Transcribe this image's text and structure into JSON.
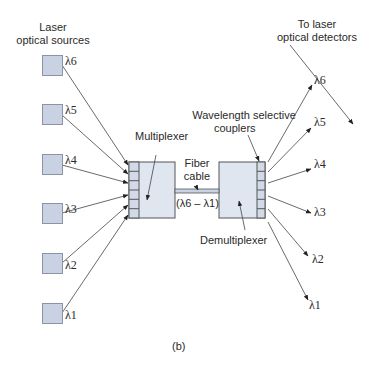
{
  "diagram": {
    "type": "wavelength-division-multiplexing",
    "caption": "(b)",
    "labels": {
      "sources_title_line1": "Laser",
      "sources_title_line2": "optical sources",
      "detectors_title_line1": "To laser",
      "detectors_title_line2": "optical detectors",
      "multiplexer": "Multiplexer",
      "demultiplexer": "Demultiplexer",
      "couplers_line1": "Wavelength selective",
      "couplers_line2": "couplers",
      "fiber_line1": "Fiber",
      "fiber_line2": "cable",
      "fiber_range": "(λ6 – λ1)"
    },
    "sources": [
      {
        "id": "source-6",
        "label": "λ6"
      },
      {
        "id": "source-5",
        "label": "λ5"
      },
      {
        "id": "source-4",
        "label": "λ4"
      },
      {
        "id": "source-3",
        "label": "λ3"
      },
      {
        "id": "source-2",
        "label": "λ2"
      },
      {
        "id": "source-1",
        "label": "λ1"
      }
    ],
    "outputs": [
      {
        "id": "output-6",
        "label": "λ6"
      },
      {
        "id": "output-5",
        "label": "λ5"
      },
      {
        "id": "output-4",
        "label": "λ4"
      },
      {
        "id": "output-3",
        "label": "λ3"
      },
      {
        "id": "output-2",
        "label": "λ2"
      },
      {
        "id": "output-1",
        "label": "λ1"
      }
    ],
    "colors": {
      "box_fill": "#dfe6f0",
      "source_fill": "#c8d2e2",
      "stroke": "#555555"
    }
  }
}
